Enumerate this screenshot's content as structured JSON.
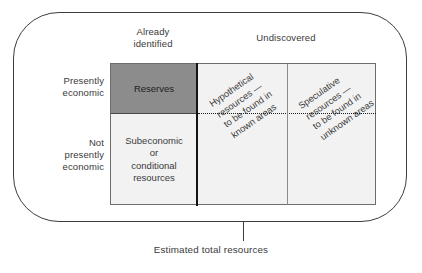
{
  "figure": {
    "caption": "Estimated total resources"
  },
  "columns": {
    "identified": "Already\nidentified",
    "undiscovered": "Undiscovered"
  },
  "rows": {
    "economic": "Presently\neconomic",
    "not_economic": "Not\npresently\neconomic"
  },
  "cells": {
    "reserves": "Reserves",
    "subeconomic": "Subeconomic\nor\nconditional\nresources",
    "hypothetical": "Hypothetical\nresources —\nto be found in\nknown areas",
    "speculative": "Speculative\nresources —\nto be found in\nunknown areas"
  },
  "colors": {
    "reserves_fill": "#8c8c8c",
    "cell_fill": "#f2f2f2",
    "outline": "#3d3d3d",
    "divider_thick": "#141414",
    "divider_thin": "#8a8a8a",
    "text": "#3a3a3a"
  }
}
